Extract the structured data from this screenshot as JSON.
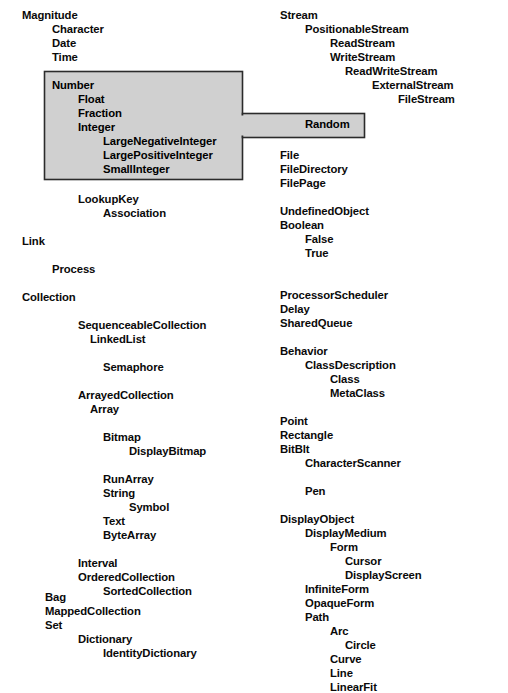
{
  "document": {
    "kind": "smalltalk-class-hierarchy-diagram",
    "background_color": "#ffffff",
    "text_color": "#0a0a0a",
    "highlight_fill_color": "#d0d0d0",
    "highlight_border_color": "#2b2b2b"
  },
  "layout": {
    "width": 508,
    "height": 661,
    "line_height": 14,
    "indent_unit": 26,
    "left_column_x": 22,
    "right_column_x": 280
  },
  "highlight": {
    "name": "selection-highlight",
    "main_box": {
      "x": 44,
      "y": 71,
      "width": 199,
      "height": 109
    },
    "tab_box": {
      "x": 243,
      "y": 113,
      "width": 122,
      "height": 25
    },
    "contains": [
      "Number",
      "Float",
      "Fraction",
      "Integer",
      "LargeNegativeInteger",
      "LargePositiveInteger",
      "SmallInteger",
      "Random"
    ]
  },
  "left_column": [
    {
      "label": "Magnitude",
      "x": 22,
      "y": 10,
      "highlighted": false
    },
    {
      "label": "Character",
      "x": 52,
      "y": 24,
      "highlighted": false
    },
    {
      "label": "Date",
      "x": 52,
      "y": 38,
      "highlighted": false
    },
    {
      "label": "Time",
      "x": 52,
      "y": 52,
      "highlighted": false
    },
    {
      "label": "Number",
      "x": 52,
      "y": 80,
      "highlighted": true
    },
    {
      "label": "Float",
      "x": 78,
      "y": 94,
      "highlighted": true
    },
    {
      "label": "Fraction",
      "x": 78,
      "y": 108,
      "highlighted": true
    },
    {
      "label": "Integer",
      "x": 78,
      "y": 122,
      "highlighted": true
    },
    {
      "label": "LargeNegativeInteger",
      "x": 103,
      "y": 136,
      "highlighted": true
    },
    {
      "label": "LargePositiveInteger",
      "x": 103,
      "y": 150,
      "highlighted": true
    },
    {
      "label": "SmallInteger",
      "x": 103,
      "y": 164,
      "highlighted": true
    },
    {
      "label": "LookupKey",
      "x": 78,
      "y": 194,
      "highlighted": false
    },
    {
      "label": "Association",
      "x": 103,
      "y": 208,
      "highlighted": false
    },
    {
      "label": "Link",
      "x": 22,
      "y": 236,
      "highlighted": false
    },
    {
      "label": "Process",
      "x": 52,
      "y": 264,
      "highlighted": false
    },
    {
      "label": "Collection",
      "x": 22,
      "y": 292,
      "highlighted": false
    },
    {
      "label": "SequenceableCollection",
      "x": 78,
      "y": 320,
      "highlighted": false
    },
    {
      "label": "LinkedList",
      "x": 90,
      "y": 334,
      "highlighted": false
    },
    {
      "label": "Semaphore",
      "x": 103,
      "y": 362,
      "highlighted": false
    },
    {
      "label": "ArrayedCollection",
      "x": 78,
      "y": 390,
      "highlighted": false
    },
    {
      "label": "Array",
      "x": 90,
      "y": 404,
      "highlighted": false
    },
    {
      "label": "Bitmap",
      "x": 103,
      "y": 432,
      "highlighted": false
    },
    {
      "label": "DisplayBitmap",
      "x": 129,
      "y": 446,
      "highlighted": false
    },
    {
      "label": "RunArray",
      "x": 103,
      "y": 474,
      "highlighted": false
    },
    {
      "label": "String",
      "x": 103,
      "y": 488,
      "highlighted": false
    },
    {
      "label": "Symbol",
      "x": 129,
      "y": 502,
      "highlighted": false
    },
    {
      "label": "Text",
      "x": 103,
      "y": 516,
      "highlighted": false
    },
    {
      "label": "ByteArray",
      "x": 103,
      "y": 530,
      "highlighted": false
    },
    {
      "label": "Interval",
      "x": 78,
      "y": 558,
      "highlighted": false
    },
    {
      "label": "OrderedCollection",
      "x": 78,
      "y": 572,
      "highlighted": false
    },
    {
      "label": "SortedCollection",
      "x": 103,
      "y": 586,
      "highlighted": false
    },
    {
      "label": "Bag",
      "x": 45,
      "y": 592,
      "highlighted": false
    },
    {
      "label": "MappedCollection",
      "x": 45,
      "y": 606,
      "highlighted": false
    },
    {
      "label": "Set",
      "x": 45,
      "y": 620,
      "highlighted": false
    },
    {
      "label": "Dictionary",
      "x": 78,
      "y": 634,
      "highlighted": false
    },
    {
      "label": "IdentityDictionary",
      "x": 103,
      "y": 648,
      "highlighted": false
    }
  ],
  "right_column": [
    {
      "label": "Stream",
      "x": 280,
      "y": 10,
      "highlighted": false
    },
    {
      "label": "PositionableStream",
      "x": 305,
      "y": 24,
      "highlighted": false
    },
    {
      "label": "ReadStream",
      "x": 330,
      "y": 38,
      "highlighted": false
    },
    {
      "label": "WriteStream",
      "x": 330,
      "y": 52,
      "highlighted": false
    },
    {
      "label": "ReadWriteStream",
      "x": 345,
      "y": 66,
      "highlighted": false
    },
    {
      "label": "ExternalStream",
      "x": 372,
      "y": 80,
      "highlighted": false
    },
    {
      "label": "FileStream",
      "x": 398,
      "y": 94,
      "highlighted": false
    },
    {
      "label": "Random",
      "x": 305,
      "y": 119,
      "highlighted": true
    },
    {
      "label": "File",
      "x": 280,
      "y": 150,
      "highlighted": false
    },
    {
      "label": "FileDirectory",
      "x": 280,
      "y": 164,
      "highlighted": false
    },
    {
      "label": "FilePage",
      "x": 280,
      "y": 178,
      "highlighted": false
    },
    {
      "label": "UndefinedObject",
      "x": 280,
      "y": 206,
      "highlighted": false
    },
    {
      "label": "Boolean",
      "x": 280,
      "y": 220,
      "highlighted": false
    },
    {
      "label": "False",
      "x": 305,
      "y": 234,
      "highlighted": false
    },
    {
      "label": "True",
      "x": 305,
      "y": 248,
      "highlighted": false
    },
    {
      "label": "ProcessorScheduler",
      "x": 280,
      "y": 290,
      "highlighted": false
    },
    {
      "label": "Delay",
      "x": 280,
      "y": 304,
      "highlighted": false
    },
    {
      "label": "SharedQueue",
      "x": 280,
      "y": 318,
      "highlighted": false
    },
    {
      "label": "Behavior",
      "x": 280,
      "y": 346,
      "highlighted": false
    },
    {
      "label": "ClassDescription",
      "x": 305,
      "y": 360,
      "highlighted": false
    },
    {
      "label": "Class",
      "x": 330,
      "y": 374,
      "highlighted": false
    },
    {
      "label": "MetaClass",
      "x": 330,
      "y": 388,
      "highlighted": false
    },
    {
      "label": "Point",
      "x": 280,
      "y": 416,
      "highlighted": false
    },
    {
      "label": "Rectangle",
      "x": 280,
      "y": 430,
      "highlighted": false
    },
    {
      "label": "BitBlt",
      "x": 280,
      "y": 444,
      "highlighted": false
    },
    {
      "label": "CharacterScanner",
      "x": 305,
      "y": 458,
      "highlighted": false
    },
    {
      "label": "Pen",
      "x": 305,
      "y": 486,
      "highlighted": false
    },
    {
      "label": "DisplayObject",
      "x": 280,
      "y": 514,
      "highlighted": false
    },
    {
      "label": "DisplayMedium",
      "x": 305,
      "y": 528,
      "highlighted": false
    },
    {
      "label": "Form",
      "x": 330,
      "y": 542,
      "highlighted": false
    },
    {
      "label": "Cursor",
      "x": 345,
      "y": 556,
      "highlighted": false
    },
    {
      "label": "DisplayScreen",
      "x": 345,
      "y": 570,
      "highlighted": false
    },
    {
      "label": "InfiniteForm",
      "x": 305,
      "y": 584,
      "highlighted": false
    },
    {
      "label": "OpaqueForm",
      "x": 305,
      "y": 598,
      "highlighted": false
    },
    {
      "label": "Path",
      "x": 305,
      "y": 612,
      "highlighted": false
    },
    {
      "label": "Arc",
      "x": 330,
      "y": 626,
      "highlighted": false
    },
    {
      "label": "Circle",
      "x": 345,
      "y": 640,
      "highlighted": false
    },
    {
      "label": "Curve",
      "x": 330,
      "y": 654,
      "highlighted": false
    },
    {
      "label": "Line",
      "x": 330,
      "y": 668,
      "highlighted": false
    },
    {
      "label": "LinearFit",
      "x": 330,
      "y": 682,
      "highlighted": false
    }
  ]
}
